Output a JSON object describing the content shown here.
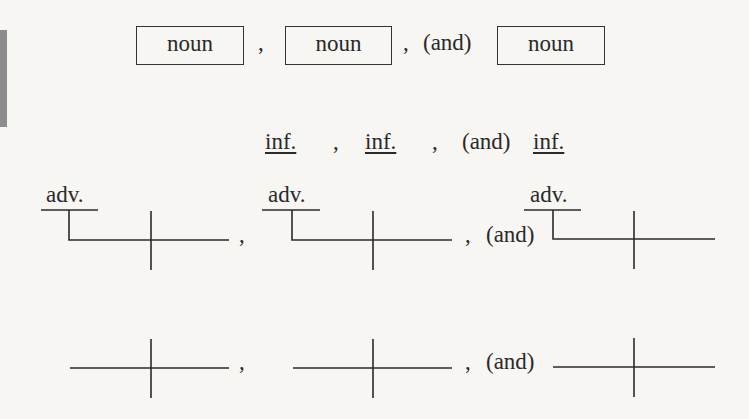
{
  "row1": {
    "boxes": [
      "noun",
      "noun",
      "noun"
    ],
    "commas": [
      ",",
      ","
    ],
    "conjunction": "(and)"
  },
  "row2": {
    "items": [
      "inf.",
      "inf.",
      "inf."
    ],
    "commas": [
      ",",
      ","
    ],
    "conjunction": "(and)"
  },
  "row3": {
    "modifiers": [
      "adv.",
      "adv.",
      "adv."
    ],
    "commas": [
      ",",
      ","
    ],
    "conjunction": "(and)"
  },
  "row4": {
    "commas": [
      ",",
      ","
    ],
    "conjunction": "(and)"
  }
}
